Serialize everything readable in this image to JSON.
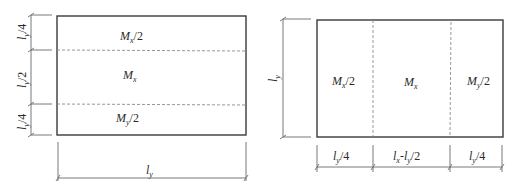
{
  "left_diagram": {
    "regions": [
      {
        "label": "M_x/2",
        "main": "M",
        "sub": "x",
        "suffix": "/2"
      },
      {
        "label": "M_x",
        "main": "M",
        "sub": "x",
        "suffix": ""
      },
      {
        "label": "M_y/2",
        "main": "M",
        "sub": "y",
        "suffix": "/2"
      }
    ],
    "vertical_dimensions": [
      {
        "label": "l_y/4",
        "main": "l",
        "sub": "y",
        "suffix": "/4"
      },
      {
        "label": "l_y/2",
        "main": "l",
        "sub": "y",
        "suffix": "/2"
      },
      {
        "label": "l_y/4",
        "main": "l",
        "sub": "y",
        "suffix": "/4"
      }
    ],
    "horizontal_dimension": {
      "label": "l_y",
      "main": "l",
      "sub": "y"
    }
  },
  "right_diagram": {
    "regions": [
      {
        "label": "M_x/2",
        "main": "M",
        "sub": "x",
        "suffix": "/2"
      },
      {
        "label": "M_x",
        "main": "M",
        "sub": "x",
        "suffix": ""
      },
      {
        "label": "M_y/2",
        "main": "M",
        "sub": "y",
        "suffix": "/2"
      }
    ],
    "vertical_dimension": {
      "label": "l_y",
      "main": "l",
      "sub": "y"
    },
    "horizontal_dimensions": [
      {
        "label": "l_y/4",
        "main": "l",
        "sub": "y",
        "suffix": "/4"
      },
      {
        "label": "l_x-l_y/2",
        "main1": "l",
        "sub1": "x",
        "sep": "-",
        "main2": "l",
        "sub2": "y",
        "suffix": "/2"
      },
      {
        "label": "l_y/4",
        "main": "l",
        "sub": "y",
        "suffix": "/4"
      }
    ]
  },
  "colors": {
    "line": "#3a3a3a",
    "dash": "#8a8a8a",
    "dim": "#6a6a6a"
  }
}
